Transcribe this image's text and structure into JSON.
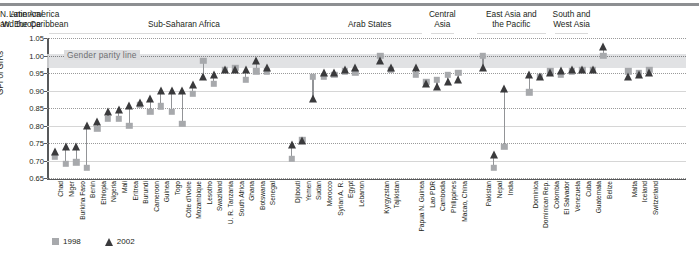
{
  "chart_data": {
    "type": "scatter",
    "title": "",
    "xlabel": "",
    "ylabel": "GPI of GIRs",
    "ylim": [
      0.65,
      1.05
    ],
    "yticks": [
      "0.65",
      "0.70",
      "0.75",
      "0.80",
      "0.85",
      "0.90",
      "0.95",
      "1.00",
      "1.05"
    ],
    "grid": true,
    "legend_position": "bottom-left",
    "annotations": [
      {
        "text": "Gender parity line",
        "value": 1.0
      }
    ],
    "parity_band": [
      0.965,
      1.005
    ],
    "series": [
      {
        "name": "1998",
        "marker": "square",
        "color": "#a7a9ac"
      },
      {
        "name": "2002",
        "marker": "triangle",
        "color": "#3a3a3c"
      }
    ],
    "regions": [
      {
        "label": "Sub-Saharan Africa",
        "start": 0,
        "end": 23
      },
      {
        "label": "Arab States",
        "start": 24,
        "end": 30
      },
      {
        "label": "Central\nAsia",
        "start": 32,
        "end": 33
      },
      {
        "label": "East Asia and\nthe Pacific",
        "start": 35,
        "end": 39
      },
      {
        "label": "South and\nWest Asia",
        "start": 41,
        "end": 43
      },
      {
        "label": "Latin America\nand the Caribbean",
        "start": 45,
        "end": 51
      },
      {
        "label": "N. America/\nW. Europe",
        "start": 53,
        "end": 55
      }
    ],
    "categories": [
      "Chad",
      "Niger",
      "Burkina Faso",
      "Benin",
      "Ethiopia",
      "Nigeria",
      "Mali",
      "Eritrea",
      "Burundi",
      "Cameroon",
      "Guinea",
      "Togo",
      "Côte d'Ivoire",
      "Mozambique",
      "Lesotho",
      "Swaziland",
      "U. R. Tanzania",
      "South Africa",
      "Ghana",
      "Botswana",
      "Senegal",
      "Djibouti",
      "Yemen",
      "Sudan",
      "Morocco",
      "Syrian A. R.",
      "Egypt",
      "Lebanon",
      "Kyrgyzstan",
      "Tajikistan",
      "Papua N. Guinea",
      "Lao PDR",
      "Cambodia",
      "Philippines",
      "Macao, China",
      "Pakistan",
      "Nepal",
      "India",
      "Dominica",
      "Dominican Rep.",
      "Colombia",
      "El Salvador",
      "Venezuela",
      "Cuba",
      "Guatemala",
      "Belize",
      "Malta",
      "Iceland",
      "Switzerland"
    ],
    "values_1998": [
      0.71,
      0.69,
      0.695,
      0.68,
      0.79,
      0.82,
      0.82,
      0.8,
      0.86,
      0.84,
      0.855,
      0.84,
      0.805,
      0.89,
      0.985,
      0.92,
      0.96,
      0.965,
      0.93,
      0.955,
      0.955,
      0.705,
      0.76,
      0.94,
      0.94,
      0.945,
      0.955,
      0.95,
      1.0,
      0.96,
      0.945,
      0.925,
      0.93,
      0.945,
      0.95,
      1.0,
      0.68,
      0.74,
      0.895,
      0.94,
      0.955,
      0.945,
      0.955,
      0.96,
      0.96,
      1.0,
      0.955,
      0.95,
      0.96
    ],
    "values_2002": [
      0.725,
      0.74,
      0.74,
      0.8,
      0.81,
      0.84,
      0.845,
      0.855,
      0.865,
      0.875,
      0.9,
      0.9,
      0.9,
      0.915,
      0.94,
      0.945,
      0.96,
      0.96,
      0.96,
      0.985,
      0.965,
      0.745,
      0.755,
      0.875,
      0.95,
      0.95,
      0.96,
      0.965,
      0.985,
      0.965,
      0.965,
      0.92,
      0.91,
      0.925,
      0.93,
      0.965,
      0.715,
      0.905,
      0.945,
      0.94,
      0.95,
      0.955,
      0.96,
      0.96,
      0.96,
      1.025,
      0.94,
      0.945,
      0.95
    ]
  },
  "legend": {
    "item1": "1998",
    "item2": "2002"
  }
}
